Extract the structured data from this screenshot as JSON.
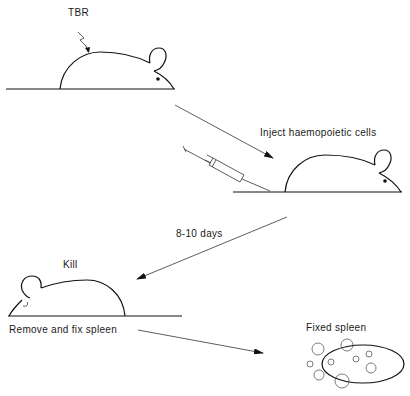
{
  "diagram": {
    "labels": {
      "irradiation": "TBR",
      "inject": "Inject haemopoietic cells",
      "interval": "8-10 days",
      "kill": "Kill",
      "remove": "Remove and fix spleen",
      "fixed_spleen": "Fixed spleen"
    },
    "steps": [
      {
        "id": "irradiate",
        "label": "TBR",
        "icon": "mouse-icon"
      },
      {
        "id": "inject",
        "label": "Inject haemopoietic cells",
        "icon": "syringe-icon"
      },
      {
        "id": "wait",
        "label": "8-10 days",
        "icon": "arrow-icon"
      },
      {
        "id": "kill",
        "label": "Kill",
        "icon": "mouse-icon"
      },
      {
        "id": "remove",
        "label": "Remove and fix spleen",
        "icon": "arrow-icon"
      },
      {
        "id": "result",
        "label": "Fixed spleen",
        "icon": "spleen-icon"
      }
    ],
    "colors": {
      "ink": "#111111",
      "background": "#ffffff"
    }
  }
}
